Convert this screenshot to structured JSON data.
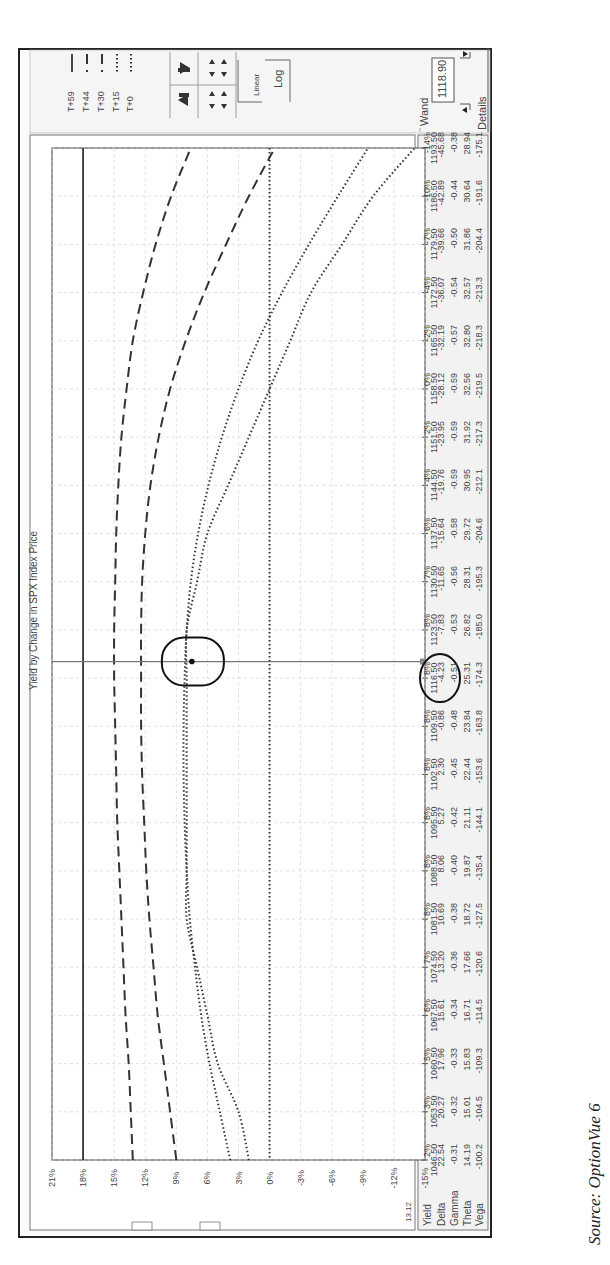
{
  "source_caption": "Source: OptionVue 6",
  "legend": {
    "items": [
      {
        "label": "T+59",
        "style": "solid"
      },
      {
        "label": "T+44",
        "style": "long-dash"
      },
      {
        "label": "T+30",
        "style": "long-dash"
      },
      {
        "label": "T+15",
        "style": "dotted"
      },
      {
        "label": "T+0",
        "style": "dotted"
      }
    ]
  },
  "controls": {
    "up_arrow_icon": "arrow-up-icon",
    "down_arrow_icon": "arrow-down-icon",
    "expand_icon": "expand-vertical-icon",
    "contract_icon": "contract-vertical-icon",
    "scale_linear_label": "Linear",
    "scale_log_label": "Log"
  },
  "wand": {
    "label": "Wand",
    "value": "1118.90",
    "details_label": "Details"
  },
  "corner_value": "13.12",
  "table": {
    "row_headers": [
      "Yield",
      "Delta",
      "Gamma",
      "Theta",
      "Vega"
    ],
    "columns": [
      {
        "price": "1046.50",
        "values": [
          "2%",
          "22.54",
          "-0.31",
          "14.19",
          "-100.2"
        ]
      },
      {
        "price": "1053.50",
        "values": [
          "3%",
          "20.27",
          "-0.32",
          "15.01",
          "-104.5"
        ]
      },
      {
        "price": "1060.50",
        "values": [
          "5%",
          "17.96",
          "-0.33",
          "15.83",
          "-109.3"
        ]
      },
      {
        "price": "1067.50",
        "values": [
          "6%",
          "15.61",
          "-0.34",
          "16.71",
          "-114.5"
        ]
      },
      {
        "price": "1074.50",
        "values": [
          "7%",
          "13.20",
          "-0.36",
          "17.66",
          "-120.6"
        ]
      },
      {
        "price": "1081.50",
        "values": [
          "8%",
          "10.69",
          "-0.38",
          "18.72",
          "-127.5"
        ]
      },
      {
        "price": "1088.50",
        "values": [
          "8%",
          "8.06",
          "-0.40",
          "19.87",
          "-135.4"
        ]
      },
      {
        "price": "1095.50",
        "values": [
          "8%",
          "5.27",
          "-0.42",
          "21.11",
          "-144.1"
        ]
      },
      {
        "price": "1102.50",
        "values": [
          "8%",
          "2.30",
          "-0.45",
          "22.44",
          "-153.6"
        ]
      },
      {
        "price": "1109.50",
        "values": [
          "8%",
          "-0.86",
          "-0.48",
          "23.84",
          "-163.8"
        ]
      },
      {
        "price": "1116.50",
        "values": [
          "8%",
          "-4.23",
          "-0.51",
          "25.31",
          "-174.3"
        ]
      },
      {
        "price": "1123.50",
        "values": [
          "8%",
          "-7.83",
          "-0.53",
          "26.82",
          "-185.0"
        ]
      },
      {
        "price": "1130.50",
        "values": [
          "7%",
          "-11.65",
          "-0.56",
          "28.31",
          "-195.3"
        ]
      },
      {
        "price": "1137.50",
        "values": [
          "6%",
          "-15.64",
          "-0.58",
          "29.72",
          "-204.6"
        ]
      },
      {
        "price": "1144.50",
        "values": [
          "4%",
          "-19.76",
          "-0.59",
          "30.95",
          "-212.1"
        ]
      },
      {
        "price": "1151.50",
        "values": [
          "2%",
          "-23.95",
          "-0.59",
          "31.92",
          "-217.3"
        ]
      },
      {
        "price": "1158.50",
        "values": [
          "0%",
          "-28.12",
          "-0.59",
          "32.56",
          "-219.5"
        ]
      },
      {
        "price": "1165.50",
        "values": [
          "-2%",
          "-32.19",
          "-0.57",
          "32.80",
          "-218.3"
        ]
      },
      {
        "price": "1172.50",
        "values": [
          "-4%",
          "-36.07",
          "-0.54",
          "32.57",
          "-213.3"
        ]
      },
      {
        "price": "1179.50",
        "values": [
          "-7%",
          "-39.66",
          "-0.50",
          "31.86",
          "-204.4"
        ]
      },
      {
        "price": "1186.50",
        "values": [
          "-10%",
          "-42.89",
          "-0.44",
          "30.64",
          "-191.6"
        ]
      },
      {
        "price": "1193.50",
        "values": [
          "-14%",
          "-45.68",
          "-0.38",
          "28.94",
          "-175.1"
        ]
      }
    ]
  },
  "chart_data": {
    "type": "line",
    "title": "Yield by Change in SPX Index Price",
    "xlabel": "SPX Index Price",
    "ylabel": "Yield",
    "orientation": "rotated 90 degrees clockwise on page",
    "x": [
      1046.5,
      1053.5,
      1060.5,
      1067.5,
      1074.5,
      1081.5,
      1088.5,
      1095.5,
      1102.5,
      1109.5,
      1116.5,
      1123.5,
      1130.5,
      1137.5,
      1144.5,
      1151.5,
      1158.5,
      1165.5,
      1172.5,
      1179.5,
      1186.5,
      1193.5
    ],
    "x_tick_labels": [
      "1046.50",
      "1053.50",
      "1060.50",
      "1067.50",
      "1074.50",
      "1081.50",
      "1088.50",
      "1095.50",
      "1102.50",
      "1109.50",
      "1116.50",
      "1123.50",
      "1130.50",
      "1137.50",
      "1144.50",
      "1151.50",
      "1158.50",
      "1165.50",
      "1172.50",
      "1179.50",
      "1186.50",
      "1193.50"
    ],
    "y_tick_labels": [
      "21%",
      "18%",
      "15%",
      "12%",
      "9%",
      "6%",
      "3%",
      "0%",
      "-3%",
      "-6%",
      "-9%",
      "-12%",
      "-15%"
    ],
    "ylim": [
      -15,
      21
    ],
    "grid": true,
    "legend_position": "top-right (rotated)",
    "series": [
      {
        "name": "T+59",
        "style": "solid",
        "values": [
          18,
          18,
          18,
          18,
          18,
          18,
          18,
          18,
          18,
          18,
          18,
          18,
          18,
          18,
          18,
          18,
          18,
          18,
          18,
          18,
          18,
          18
        ]
      },
      {
        "name": "T+44",
        "style": "long-dash",
        "values": [
          13.2,
          13.4,
          13.6,
          13.9,
          14.1,
          14.3,
          14.5,
          14.7,
          14.8,
          14.9,
          15.0,
          15.0,
          14.9,
          14.8,
          14.6,
          14.3,
          13.8,
          13.2,
          12.2,
          11.0,
          9.5,
          7.6
        ]
      },
      {
        "name": "T+30",
        "style": "long-dash",
        "values": [
          9.0,
          9.6,
          10.2,
          10.8,
          11.2,
          11.6,
          11.9,
          12.1,
          12.3,
          12.4,
          12.4,
          12.4,
          12.3,
          12.0,
          11.5,
          10.7,
          9.6,
          8.1,
          6.3,
          4.2,
          2.0,
          -0.5
        ]
      },
      {
        "name": "T+15",
        "style": "dotted",
        "values": [
          3.8,
          4.8,
          5.8,
          6.6,
          7.2,
          7.7,
          8.0,
          8.2,
          8.3,
          8.3,
          8.2,
          8.0,
          7.6,
          6.9,
          5.9,
          4.6,
          3.0,
          1.1,
          -1.2,
          -3.8,
          -6.6,
          -9.5
        ]
      },
      {
        "name": "T+0",
        "style": "dotted",
        "values": [
          2,
          3,
          5,
          6,
          7,
          8,
          8,
          8,
          8,
          8,
          8,
          8,
          7,
          6,
          4,
          2,
          0,
          -2,
          -4,
          -7,
          -10,
          -14
        ]
      }
    ],
    "annotations": [
      {
        "type": "horizontal-reference",
        "y": 0,
        "style": "dotted",
        "note": "0% line"
      },
      {
        "type": "cursor",
        "x": 1118.9,
        "label": "Wand 1118.90"
      },
      {
        "type": "circle",
        "x": 1118.9,
        "y": 7.5,
        "note": "circled marker on T+0 curve"
      },
      {
        "type": "circle",
        "target": "table Yield at 1116.50 = 8%"
      }
    ]
  }
}
